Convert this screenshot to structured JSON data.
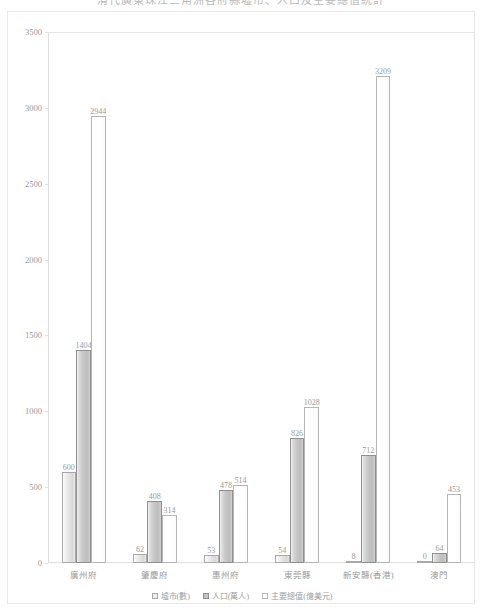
{
  "chart_data": {
    "type": "bar",
    "title": "清代廣東珠江三角洲各府縣墟市、人口及主要總值統計",
    "xlabel": "",
    "ylabel": "",
    "ylim": [
      0,
      3500
    ],
    "yticks": [
      0,
      500,
      1000,
      1500,
      2000,
      2500,
      3000,
      3500
    ],
    "grid": false,
    "legend_position": "bottom",
    "categories": [
      "廣州府",
      "肇慶府",
      "惠州府",
      "東莞縣",
      "新安縣(香港)",
      "澳門"
    ],
    "series": [
      {
        "name": "墟市(數)",
        "values": [
          600,
          62,
          53,
          54,
          8,
          0
        ]
      },
      {
        "name": "人口(萬人)",
        "values": [
          1404,
          408,
          478,
          826,
          712,
          64
        ]
      },
      {
        "name": "主要總值(億美元)",
        "values": [
          2944,
          314,
          514,
          1028,
          3209,
          453
        ]
      }
    ],
    "value_labels": [
      [
        "600",
        "62",
        "53",
        "54",
        "8",
        "0"
      ],
      [
        "1404",
        "408",
        "478",
        "826",
        "712",
        "64"
      ],
      [
        "2944",
        "314",
        "514",
        "1028",
        "3209",
        "453"
      ]
    ]
  },
  "axis": {
    "y_tick_labels": [
      "3500",
      "3000",
      "2500",
      "2000",
      "1500",
      "1000",
      "500",
      "0"
    ]
  }
}
